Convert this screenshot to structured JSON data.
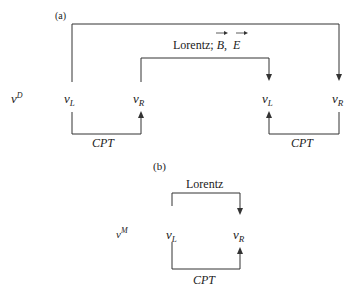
{
  "diagram": {
    "part_a": {
      "label": "(a)",
      "row_label": "ν",
      "row_label_sup": "D",
      "nodes": [
        {
          "symbol": "ν",
          "sub": "L"
        },
        {
          "symbol": "ν",
          "sub": "R"
        },
        {
          "symbol": "ν",
          "sub": "L"
        },
        {
          "symbol": "ν",
          "sub": "R"
        }
      ],
      "inner_connection_label": "Lorentz; ",
      "field_b": "B",
      "field_sep": ",",
      "field_e": "E",
      "cpt_left": "CPT",
      "cpt_right": "CPT"
    },
    "part_b": {
      "label": "(b)",
      "row_label": "ν",
      "row_label_sup": "M",
      "nodes": [
        {
          "symbol": "ν",
          "sub": "L"
        },
        {
          "symbol": "ν",
          "sub": "R"
        }
      ],
      "top_connection_label": "Lorentz",
      "cpt": "CPT"
    },
    "colors": {
      "line": "#333333",
      "background": "#ffffff"
    }
  }
}
